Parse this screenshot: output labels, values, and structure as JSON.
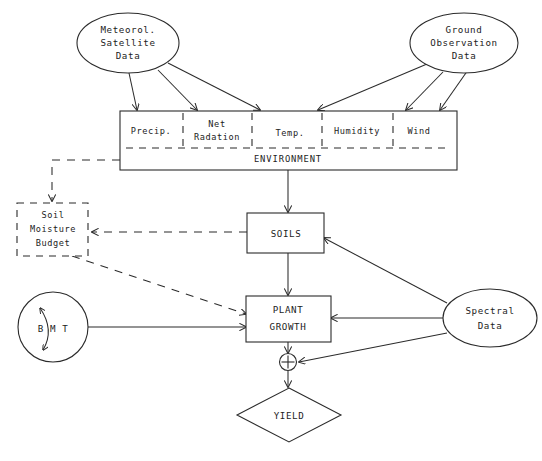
{
  "diagram": {
    "type": "flow-diagram",
    "stroke_color": "#2b2b2b",
    "background_color": "#ffffff",
    "nodes": {
      "meteorol_satellite": {
        "shape": "ellipse",
        "lines": [
          "Meteorol.",
          "Satellite",
          "Data"
        ]
      },
      "ground_observation": {
        "shape": "ellipse",
        "lines": [
          "Ground",
          "Observation",
          "Data"
        ]
      },
      "environment": {
        "shape": "rectangle",
        "label": "ENVIRONMENT",
        "compartments": [
          {
            "id": "precip",
            "label": "Precip.",
            "lines": [
              "Precip."
            ]
          },
          {
            "id": "net-radiation",
            "label": "Net Radation",
            "lines": [
              "Net",
              "Radation"
            ]
          },
          {
            "id": "temp",
            "label": "Temp.",
            "lines": [
              "Temp."
            ]
          },
          {
            "id": "humidity",
            "label": "Humidity",
            "lines": [
              "Humidity"
            ]
          },
          {
            "id": "wind",
            "label": "Wind",
            "lines": [
              "Wind"
            ]
          }
        ]
      },
      "soil_moisture_budget": {
        "shape": "rectangle-dashed",
        "lines": [
          "Soil",
          "Moisture",
          "Budget"
        ]
      },
      "soils": {
        "shape": "rectangle",
        "lines": [
          "SOILS"
        ]
      },
      "plant_growth": {
        "shape": "rectangle",
        "lines": [
          "PLANT",
          "GROWTH"
        ]
      },
      "bmt": {
        "shape": "circle",
        "lines": [
          "B M T"
        ]
      },
      "spectral_data": {
        "shape": "ellipse",
        "lines": [
          "Spectral",
          "Data"
        ]
      },
      "summation": {
        "shape": "circle-plus",
        "label": "+"
      },
      "yield": {
        "shape": "diamond",
        "lines": [
          "YIELD"
        ]
      }
    },
    "edges": [
      {
        "id": "met-to-precip",
        "from": "meteorol_satellite",
        "to": "environment.precip",
        "style": "solid"
      },
      {
        "id": "met-to-netradiation",
        "from": "meteorol_satellite",
        "to": "environment.net-radiation",
        "style": "solid"
      },
      {
        "id": "met-to-temp",
        "from": "meteorol_satellite",
        "to": "environment.temp",
        "style": "solid"
      },
      {
        "id": "ground-to-temp",
        "from": "ground_observation",
        "to": "environment.temp",
        "style": "solid"
      },
      {
        "id": "ground-to-humidity",
        "from": "ground_observation",
        "to": "environment.humidity",
        "style": "solid"
      },
      {
        "id": "ground-to-wind",
        "from": "ground_observation",
        "to": "environment.wind",
        "style": "solid"
      },
      {
        "id": "environment-to-soils",
        "from": "environment",
        "to": "soils",
        "style": "solid"
      },
      {
        "id": "environment-to-soil-moisture-budget",
        "from": "environment",
        "to": "soil_moisture_budget",
        "style": "dashed"
      },
      {
        "id": "soils-to-soil-moisture-budget",
        "from": "soils",
        "to": "soil_moisture_budget",
        "style": "dashed"
      },
      {
        "id": "soil-moisture-budget-to-plant-growth",
        "from": "soil_moisture_budget",
        "to": "plant_growth",
        "style": "dashed"
      },
      {
        "id": "soils-to-plant-growth",
        "from": "soils",
        "to": "plant_growth",
        "style": "solid"
      },
      {
        "id": "bmt-to-plant-growth",
        "from": "bmt",
        "to": "plant_growth",
        "style": "solid"
      },
      {
        "id": "spectral-to-soils",
        "from": "spectral_data",
        "to": "soils",
        "style": "solid"
      },
      {
        "id": "spectral-to-plant-growth",
        "from": "spectral_data",
        "to": "plant_growth",
        "style": "solid"
      },
      {
        "id": "spectral-to-summation",
        "from": "spectral_data",
        "to": "summation",
        "style": "solid"
      },
      {
        "id": "plant-growth-to-summation",
        "from": "plant_growth",
        "to": "summation",
        "style": "solid"
      },
      {
        "id": "summation-to-yield",
        "from": "summation",
        "to": "yield",
        "style": "solid"
      },
      {
        "id": "bmt-internal",
        "from": "bmt",
        "to": "bmt",
        "style": "solid"
      }
    ]
  }
}
